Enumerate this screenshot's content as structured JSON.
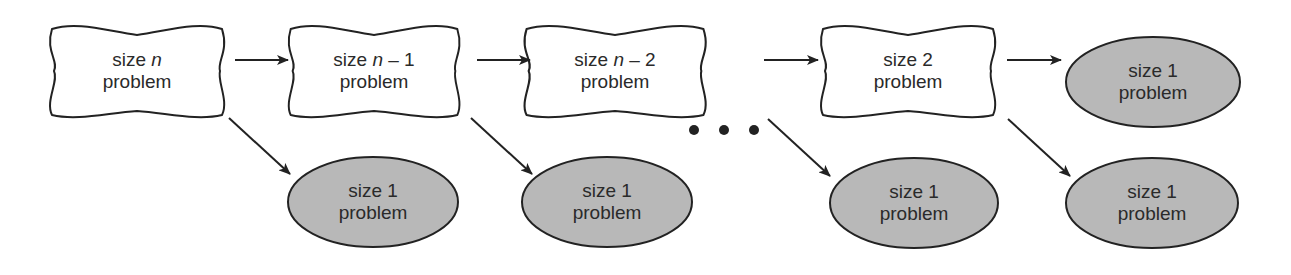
{
  "diagram": {
    "colors": {
      "stroke": "#222222",
      "ellipse_fill": "#b8b8b8",
      "text": "#2a2a2a"
    },
    "chain_nodes": [
      {
        "id": "n",
        "line1_prefix": "size ",
        "line1_var": "n",
        "line1_suffix": "",
        "line2": "problem",
        "cx": 137,
        "cy": 71
      },
      {
        "id": "n-1",
        "line1_prefix": "size ",
        "line1_var": "n",
        "line1_suffix": " – 1",
        "line2": "problem",
        "cx": 374,
        "cy": 71
      },
      {
        "id": "n-2",
        "line1_prefix": "size ",
        "line1_var": "n",
        "line1_suffix": " – 2",
        "line2": "problem",
        "cx": 615,
        "cy": 71
      },
      {
        "id": "2",
        "line1_prefix": "size 2",
        "line1_var": "",
        "line1_suffix": "",
        "line2": "problem",
        "cx": 908,
        "cy": 71
      }
    ],
    "base_nodes": [
      {
        "line1": "size 1",
        "line2": "problem",
        "cx": 1153,
        "cy": 82
      },
      {
        "line1": "size 1",
        "line2": "problem",
        "cx": 373,
        "cy": 202
      },
      {
        "line1": "size 1",
        "line2": "problem",
        "cx": 607,
        "cy": 202
      },
      {
        "line1": "size 1",
        "line2": "problem",
        "cx": 914,
        "cy": 203
      },
      {
        "line1": "size 1",
        "line2": "problem",
        "cx": 1152,
        "cy": 203
      }
    ],
    "ellipsis": "• • •"
  }
}
